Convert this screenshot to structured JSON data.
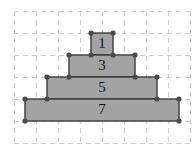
{
  "figure": {
    "background_color": "#ffffff",
    "grid": {
      "visible": true,
      "style": "dashed",
      "color": "#cfcfd4",
      "cell_size": 22,
      "origin_x": 14,
      "origin_y": 11,
      "columns": 8,
      "rows": 6
    },
    "style": {
      "bar_fill": "#a3a3a3",
      "bar_stroke": "#3a3a3a",
      "vertex_color": "#4a4a4a",
      "vertex_radius": 2.6,
      "label_color": "#1a1a1a"
    },
    "bars": [
      {
        "label": "1",
        "value": 1,
        "width_cells": 1,
        "row_from_top": 0,
        "left_cell": 3.5,
        "center_cell": 4
      },
      {
        "label": "3",
        "value": 3,
        "width_cells": 3,
        "row_from_top": 1,
        "left_cell": 2.5,
        "center_cell": 4
      },
      {
        "label": "5",
        "value": 5,
        "width_cells": 5,
        "row_from_top": 2,
        "left_cell": 1.5,
        "center_cell": 4
      },
      {
        "label": "7",
        "value": 7,
        "width_cells": 7,
        "row_from_top": 3,
        "left_cell": 0.5,
        "center_cell": 4
      }
    ]
  },
  "chart_data": {
    "type": "bar",
    "title": "",
    "orientation": "horizontal-centered",
    "categories": [
      "1",
      "3",
      "5",
      "7"
    ],
    "values": [
      1,
      3,
      5,
      7
    ],
    "labels": [
      "1",
      "3",
      "5",
      "7"
    ],
    "xlabel": "",
    "ylabel": "",
    "xlim": [
      0,
      8
    ],
    "ylim": [
      0,
      6
    ],
    "grid": true,
    "legend": "none"
  }
}
